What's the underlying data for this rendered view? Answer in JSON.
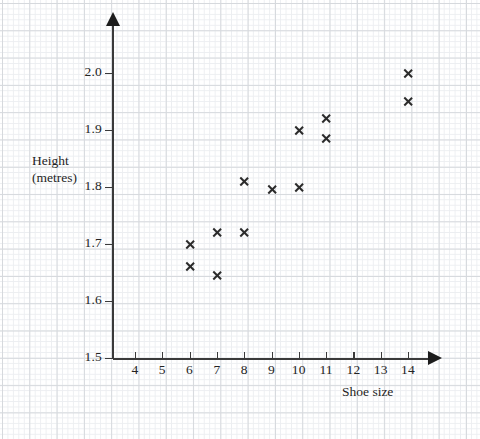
{
  "chart_data": {
    "type": "scatter",
    "title": "",
    "xlabel": "Shoe size",
    "ylabel": "Height (metres)",
    "ylabel_lines": [
      "Height",
      "(metres)"
    ],
    "xlim": [
      3.2,
      14.8
    ],
    "ylim": [
      1.5,
      2.05
    ],
    "xticks": [
      4,
      5,
      6,
      7,
      8,
      9,
      10,
      11,
      12,
      13,
      14
    ],
    "xtick_labels": [
      "4",
      "5",
      "6",
      "7",
      "8",
      "9",
      "10",
      "11",
      "12",
      "13",
      "14"
    ],
    "yticks": [
      1.5,
      1.6,
      1.7,
      1.8,
      1.9,
      2.0
    ],
    "ytick_labels": [
      "1.5",
      "1.6",
      "1.7",
      "1.8",
      "1.9",
      "2.0"
    ],
    "grid": true,
    "grid_style": "graph-paper",
    "legend": "none",
    "marker": "x",
    "marker_color": "#2b2b2b",
    "points": [
      {
        "x": 6,
        "y": 1.7
      },
      {
        "x": 6,
        "y": 1.66
      },
      {
        "x": 7,
        "y": 1.72
      },
      {
        "x": 7,
        "y": 1.645
      },
      {
        "x": 8,
        "y": 1.81
      },
      {
        "x": 8,
        "y": 1.72
      },
      {
        "x": 9,
        "y": 1.795
      },
      {
        "x": 10,
        "y": 1.8
      },
      {
        "x": 10,
        "y": 1.9
      },
      {
        "x": 11,
        "y": 1.92
      },
      {
        "x": 11,
        "y": 1.885
      },
      {
        "x": 14,
        "y": 2.0
      },
      {
        "x": 14,
        "y": 1.95
      }
    ]
  },
  "axes": {
    "x_axis_name": "shoe-size-axis",
    "y_axis_name": "height-axis"
  },
  "top_caption": ""
}
